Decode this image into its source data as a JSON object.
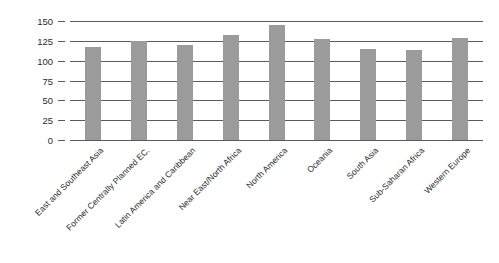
{
  "chart_data": {
    "type": "bar",
    "title": "",
    "subtitle": "",
    "xlabel": "",
    "ylabel": "",
    "categories": [
      "East and Southeast Asia",
      "Former Centrally Planned EC.",
      "Latin America and Caribbean",
      "Near East/North Africa",
      "North America",
      "Oceania",
      "South Asia",
      "Sub-Saharan Africa",
      "Western Europe"
    ],
    "values": [
      117,
      125,
      120,
      133,
      145,
      127,
      115,
      113,
      128
    ],
    "ylim": [
      0,
      150
    ],
    "ytick_labels": [
      "150",
      "125",
      "100",
      "75",
      "50",
      "25",
      "0"
    ],
    "ytick_values": [
      150,
      125,
      100,
      75,
      50,
      25,
      0
    ],
    "grid": true,
    "legend": false,
    "legend_position": "none",
    "bar_color": "#9b9b9b",
    "grid_color": "#5b5b5b",
    "axis_color": "#5b5b5b",
    "text_color": "#2b2b2b",
    "background": "#ffffff",
    "xlabel_rotation": -45
  }
}
